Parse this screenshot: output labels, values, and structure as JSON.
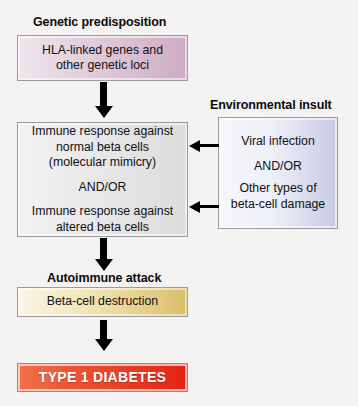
{
  "diagram": {
    "background_color": "#f4f3f1",
    "headings": {
      "genetic": "Genetic predisposition",
      "environmental": "Environmental insult",
      "autoimmune": "Autoimmune attack"
    },
    "boxes": {
      "genetic": {
        "line1": "HLA-linked genes and",
        "line2": "other genetic loci",
        "gradient_from": "#efe6ec",
        "gradient_to": "#ceabc4"
      },
      "immune": {
        "line1": "Immune response against",
        "line2": "normal beta cells",
        "line3": "(molecular mimicry)",
        "connector": "AND/OR",
        "line4": "Immune response against",
        "line5": "altered beta cells",
        "gradient_from": "#f2f2f2",
        "gradient_to": "#dcdcdc"
      },
      "environmental": {
        "line1": "Viral infection",
        "connector": "AND/OR",
        "line2": "Other types of",
        "line3": "beta-cell damage",
        "gradient_from": "#f6f7fb",
        "gradient_to": "#c9c9e4"
      },
      "betacell": {
        "line1": "Beta-cell destruction",
        "gradient_from": "#faf6e4",
        "gradient_to": "#d9bf68"
      },
      "diabetes": {
        "line1": "TYPE 1 DIABETES",
        "gradient_from": "#f0704a",
        "gradient_to": "#e32314",
        "text_color": "#ffffff"
      }
    },
    "arrows": {
      "genetic_to_immune": "down-arrow",
      "immune_to_betacell": "down-arrow",
      "betacell_to_diabetes": "down-arrow",
      "environmental_to_immune_top": "left-arrow",
      "environmental_to_immune_bottom": "left-arrow"
    }
  }
}
